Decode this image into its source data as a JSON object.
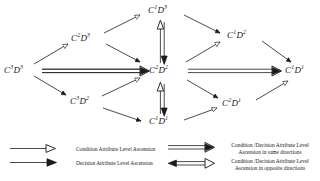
{
  "diagram": {
    "nodes": [
      {
        "id": "n-c3d3",
        "base": "C",
        "sup1": "3",
        "base2": "D",
        "sup2": "3",
        "x": 4,
        "y": 66
      },
      {
        "id": "n-c2d3",
        "base": "C",
        "sup1": "2",
        "base2": "D",
        "sup2": "3",
        "x": 71,
        "y": 34
      },
      {
        "id": "n-c3d2",
        "base": "C",
        "sup1": "3",
        "base2": "D",
        "sup2": "2",
        "x": 70,
        "y": 97
      },
      {
        "id": "n-c1d3",
        "base": "C",
        "sup1": "1",
        "base2": "D",
        "sup2": "3",
        "x": 148,
        "y": 6
      },
      {
        "id": "n-c2d2",
        "base": "C",
        "sup1": "2",
        "base2": "D",
        "sup2": "2",
        "x": 149,
        "y": 66
      },
      {
        "id": "n-c1d1",
        "base": "C",
        "sup1": "1",
        "base2": "D",
        "sup2": "1",
        "x": 149,
        "y": 117
      },
      {
        "id": "n-c1d2",
        "base": "C",
        "sup1": "1",
        "base2": "D",
        "sup2": "2",
        "x": 227,
        "y": 31
      },
      {
        "id": "n-c2d1",
        "base": "C",
        "sup1": "2",
        "base2": "D",
        "sup2": "1",
        "x": 222,
        "y": 99
      },
      {
        "id": "n-c1d1r",
        "base": "C",
        "sup1": "1",
        "base2": "D",
        "sup2": "1",
        "x": 285,
        "y": 66
      }
    ],
    "legend": {
      "items": [
        {
          "id": "legend-condition",
          "arrow": "hollow-single-right",
          "label": "Condition Attribute Level Ascension"
        },
        {
          "id": "legend-decision",
          "arrow": "filled-single-right",
          "label": "Decision Attribute Level Ascension"
        },
        {
          "id": "legend-same",
          "arrow": "double-same-right",
          "line1": "Condition /Decision Attribute Level",
          "line2": "Ascension in same directions"
        },
        {
          "id": "legend-opposite",
          "arrow": "double-opposite",
          "line1": "Condition /Decision Attribute Level",
          "line2": "Ascension in opposite directions"
        }
      ]
    },
    "colors": {
      "ink": "#1a1a1a",
      "stroke": "#2b2b2b",
      "background": "#ffffff"
    }
  }
}
